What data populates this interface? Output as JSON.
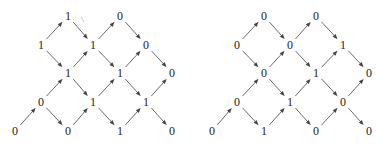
{
  "diagrams": [
    {
      "name": "left-lattice",
      "nodes": [
        {
          "id": "a1",
          "label": "1",
          "x": 68,
          "y": 16
        },
        {
          "id": "a2",
          "label": "0",
          "x": 120,
          "y": 16
        },
        {
          "id": "b0",
          "label": "1",
          "x": 41,
          "y": 45
        },
        {
          "id": "b1",
          "label": "1",
          "x": 93,
          "y": 45
        },
        {
          "id": "b2",
          "label": "0",
          "x": 146,
          "y": 45
        },
        {
          "id": "c0",
          "label": "1",
          "x": 68,
          "y": 73
        },
        {
          "id": "c1",
          "label": "1",
          "x": 120,
          "y": 73
        },
        {
          "id": "c2",
          "label": "0",
          "x": 172,
          "y": 73
        },
        {
          "id": "d0",
          "label": "0",
          "x": 41,
          "y": 102
        },
        {
          "id": "d1",
          "label": "1",
          "x": 93,
          "y": 102
        },
        {
          "id": "d2",
          "label": "1",
          "x": 146,
          "y": 102
        },
        {
          "id": "e0",
          "label": "0",
          "x": 15,
          "y": 131
        },
        {
          "id": "e1",
          "label": "0",
          "x": 68,
          "y": 131
        },
        {
          "id": "e2",
          "label": "1",
          "x": 120,
          "y": 131
        },
        {
          "id": "e3",
          "label": "0",
          "x": 172,
          "y": 131
        }
      ],
      "edges": [
        [
          "b0",
          "a1"
        ],
        [
          "a1",
          "b1"
        ],
        [
          "b1",
          "a2"
        ],
        [
          "a2",
          "b2"
        ],
        [
          "b0",
          "c0"
        ],
        [
          "c0",
          "b1"
        ],
        [
          "b1",
          "c1"
        ],
        [
          "c1",
          "b2"
        ],
        [
          "b2",
          "c2"
        ],
        [
          "d0",
          "c0"
        ],
        [
          "c0",
          "d1"
        ],
        [
          "d1",
          "c1"
        ],
        [
          "c1",
          "d2"
        ],
        [
          "d2",
          "c2"
        ],
        [
          "e0",
          "d0"
        ],
        [
          "d0",
          "e1"
        ],
        [
          "e1",
          "d1"
        ],
        [
          "d1",
          "e2"
        ],
        [
          "e2",
          "d2"
        ],
        [
          "d2",
          "e3"
        ]
      ],
      "stray_mark": {
        "x1": 81,
        "y1": 17,
        "x2": 84,
        "y2": 22
      }
    },
    {
      "name": "right-lattice",
      "nodes": [
        {
          "id": "a1",
          "label": "0",
          "x": 264,
          "y": 16
        },
        {
          "id": "a2",
          "label": "0",
          "x": 316,
          "y": 16
        },
        {
          "id": "b0",
          "label": "0",
          "x": 237,
          "y": 45
        },
        {
          "id": "b1",
          "label": "0",
          "x": 290,
          "y": 45
        },
        {
          "id": "b2",
          "label": "1",
          "x": 343,
          "y": 45
        },
        {
          "id": "c0",
          "label": "0",
          "x": 264,
          "y": 73
        },
        {
          "id": "c1",
          "label": "1",
          "x": 316,
          "y": 73
        },
        {
          "id": "c2",
          "label": "0",
          "x": 369,
          "y": 73
        },
        {
          "id": "d0",
          "label": "0",
          "x": 237,
          "y": 102
        },
        {
          "id": "d1",
          "label": "1",
          "x": 290,
          "y": 102
        },
        {
          "id": "d2",
          "label": "0",
          "x": 343,
          "y": 102
        },
        {
          "id": "e0",
          "label": "0",
          "x": 212,
          "y": 131
        },
        {
          "id": "e1",
          "label": "1",
          "x": 264,
          "y": 131
        },
        {
          "id": "e2",
          "label": "0",
          "x": 316,
          "y": 131
        },
        {
          "id": "e3",
          "label": "0",
          "x": 369,
          "y": 131
        }
      ],
      "edges": [
        [
          "b0",
          "a1"
        ],
        [
          "a1",
          "b1"
        ],
        [
          "b1",
          "a2"
        ],
        [
          "a2",
          "b2"
        ],
        [
          "b0",
          "c0"
        ],
        [
          "c0",
          "b1"
        ],
        [
          "b1",
          "c1"
        ],
        [
          "c1",
          "b2"
        ],
        [
          "b2",
          "c2"
        ],
        [
          "d0",
          "c0"
        ],
        [
          "c0",
          "d1"
        ],
        [
          "d1",
          "c1"
        ],
        [
          "c1",
          "d2"
        ],
        [
          "d2",
          "c2"
        ],
        [
          "e0",
          "d0"
        ],
        [
          "d0",
          "e1"
        ],
        [
          "e1",
          "d1"
        ],
        [
          "d1",
          "e2"
        ],
        [
          "e2",
          "d2"
        ],
        [
          "d2",
          "e3"
        ]
      ]
    }
  ]
}
